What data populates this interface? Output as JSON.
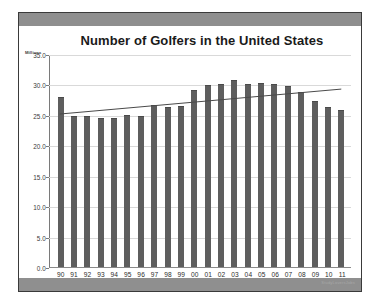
{
  "slide": {
    "footer_watermark": "StudyLoversJobs",
    "source_note": "Source:  National Golf Foundation"
  },
  "chart_data": {
    "type": "bar",
    "title": "Number of Golfers in the United States",
    "subtitle": "",
    "xlabel": "",
    "ylabel": "Millions",
    "unit_label": "Millions",
    "ylim": [
      0.0,
      35.0
    ],
    "ytick_step": 5.0,
    "ytick_labels": [
      "35.0",
      "30.0",
      "25.0",
      "20.0",
      "15.0",
      "10.0",
      "5.0",
      "0.0"
    ],
    "ytick_values": [
      35.0,
      30.0,
      25.0,
      20.0,
      15.0,
      10.0,
      5.0,
      0.0
    ],
    "grid": true,
    "legend": "none",
    "bar_color": "#5e5e5e",
    "trendline_color": "#4a4a4a",
    "categories": [
      "90",
      "91",
      "92",
      "93",
      "94",
      "95",
      "96",
      "97",
      "98",
      "99",
      "00",
      "01",
      "02",
      "03",
      "04",
      "05",
      "06",
      "07",
      "08",
      "09",
      "10",
      "11"
    ],
    "values": [
      27.8,
      24.7,
      24.6,
      24.4,
      24.3,
      24.8,
      24.6,
      26.5,
      26.2,
      26.3,
      29.0,
      29.8,
      29.9,
      30.6,
      29.9,
      30.0,
      29.9,
      29.5,
      28.6,
      27.1,
      26.1,
      25.7
    ],
    "series": [
      {
        "name": "Number of Golfers",
        "values": [
          27.8,
          24.7,
          24.6,
          24.4,
          24.3,
          24.8,
          24.6,
          26.5,
          26.2,
          26.3,
          29.0,
          29.8,
          29.9,
          30.6,
          29.9,
          30.0,
          29.9,
          29.5,
          28.6,
          27.1,
          26.1,
          25.7
        ]
      }
    ],
    "trendline": {
      "type": "linear",
      "start_value": 25.3,
      "end_value": 29.4
    },
    "annotations": [
      "Source:  National Golf Foundation"
    ]
  }
}
